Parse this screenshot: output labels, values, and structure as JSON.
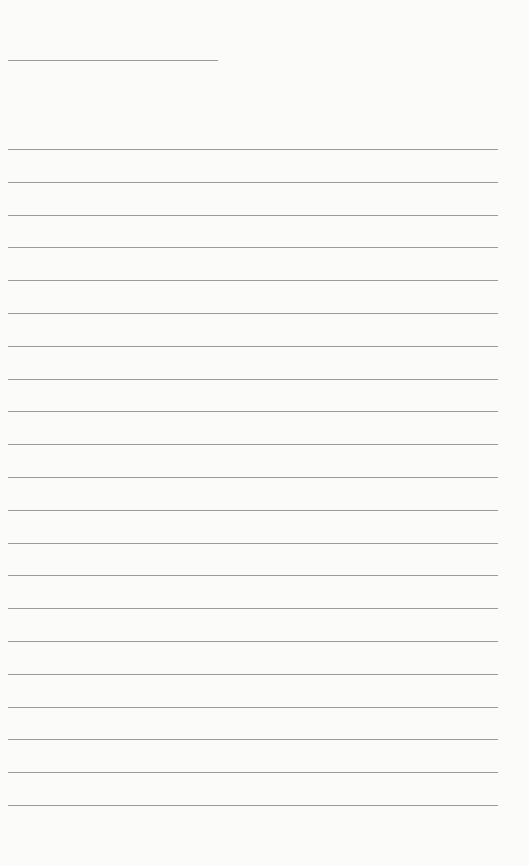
{
  "page": {
    "type": "lined-paper",
    "header_line": {
      "present": true
    },
    "line_count": 21,
    "line_color": "#8a8a8a",
    "background_color": "#fbfbfa"
  }
}
